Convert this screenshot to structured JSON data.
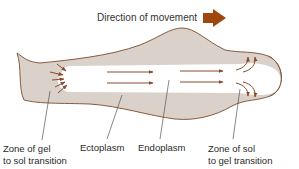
{
  "diagram": {
    "title": "Direction of movement",
    "colors": {
      "ectoplasm_fill": "#d9d1ca",
      "outline": "#8a5a3a",
      "arrow": "#8a4b2a",
      "direction_arrow": "#a0460f",
      "endoplasm_fill": "#ffffff",
      "leader_line": "#555555"
    },
    "labels": {
      "gel_to_sol": {
        "line1": "Zone of gel",
        "line2": "to sol transition"
      },
      "ectoplasm": "Ectoplasm",
      "endoplasm": "Endoplasm",
      "sol_to_gel": {
        "line1": "Zone of sol",
        "line2": "to gel transition"
      }
    },
    "icons": {
      "direction_arrow": "right-arrow-icon"
    }
  }
}
